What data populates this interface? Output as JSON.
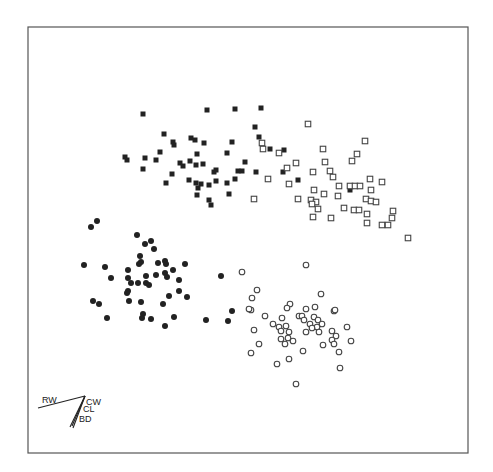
{
  "chart_data": {
    "type": "scatter",
    "title": "",
    "xlabel": "",
    "ylabel": "",
    "grid": false,
    "legend": null,
    "frame": {
      "x0": 28,
      "y0": 27,
      "x1": 468,
      "y1": 453
    },
    "series": [
      {
        "name": "group-filled-square",
        "marker": "filled-square",
        "points": [
          [
            143,
            114
          ],
          [
            207,
            110
          ],
          [
            235,
            109
          ],
          [
            261,
            108
          ],
          [
            255,
            127
          ],
          [
            259,
            137
          ],
          [
            270,
            149
          ],
          [
            284,
            150
          ],
          [
            164,
            134
          ],
          [
            173,
            142
          ],
          [
            174,
            145
          ],
          [
            191,
            138
          ],
          [
            195,
            140
          ],
          [
            204,
            143
          ],
          [
            232,
            142
          ],
          [
            125,
            157
          ],
          [
            127,
            160
          ],
          [
            145,
            158
          ],
          [
            156,
            160
          ],
          [
            160,
            152
          ],
          [
            143,
            169
          ],
          [
            180,
            163
          ],
          [
            183,
            166
          ],
          [
            190,
            161
          ],
          [
            197,
            154
          ],
          [
            196,
            165
          ],
          [
            203,
            164
          ],
          [
            227,
            153
          ],
          [
            245,
            162
          ],
          [
            242,
            171
          ],
          [
            256,
            172
          ],
          [
            283,
            172
          ],
          [
            298,
            180
          ],
          [
            172,
            174
          ],
          [
            166,
            183
          ],
          [
            189,
            180
          ],
          [
            196,
            183
          ],
          [
            201,
            184
          ],
          [
            198,
            188
          ],
          [
            209,
            185
          ],
          [
            216,
            181
          ],
          [
            214,
            172
          ],
          [
            216,
            170
          ],
          [
            227,
            183
          ],
          [
            235,
            179
          ],
          [
            238,
            171
          ],
          [
            197,
            195
          ],
          [
            209,
            200
          ],
          [
            211,
            205
          ],
          [
            229,
            194
          ],
          [
            350,
            190
          ]
        ]
      },
      {
        "name": "group-open-square",
        "marker": "open-square",
        "points": [
          [
            308,
            124
          ],
          [
            365,
            141
          ],
          [
            262,
            143
          ],
          [
            263,
            149
          ],
          [
            279,
            153
          ],
          [
            323,
            149
          ],
          [
            357,
            154
          ],
          [
            352,
            161
          ],
          [
            296,
            163
          ],
          [
            325,
            162
          ],
          [
            287,
            168
          ],
          [
            313,
            172
          ],
          [
            330,
            171
          ],
          [
            333,
            177
          ],
          [
            268,
            179
          ],
          [
            289,
            184
          ],
          [
            339,
            186
          ],
          [
            350,
            186
          ],
          [
            355,
            186
          ],
          [
            360,
            186
          ],
          [
            370,
            179
          ],
          [
            382,
            182
          ],
          [
            314,
            190
          ],
          [
            324,
            194
          ],
          [
            338,
            196
          ],
          [
            371,
            190
          ],
          [
            254,
            199
          ],
          [
            298,
            199
          ],
          [
            311,
            200
          ],
          [
            316,
            202
          ],
          [
            312,
            204
          ],
          [
            318,
            209
          ],
          [
            344,
            208
          ],
          [
            354,
            210
          ],
          [
            359,
            210
          ],
          [
            366,
            199
          ],
          [
            371,
            201
          ],
          [
            376,
            202
          ],
          [
            367,
            214
          ],
          [
            313,
            217
          ],
          [
            331,
            218
          ],
          [
            367,
            223
          ],
          [
            382,
            225
          ],
          [
            388,
            225
          ],
          [
            392,
            218
          ],
          [
            393,
            211
          ],
          [
            408,
            238
          ]
        ]
      },
      {
        "name": "group-filled-circle",
        "marker": "filled-circle",
        "points": [
          [
            97,
            221
          ],
          [
            91,
            227
          ],
          [
            137,
            235
          ],
          [
            145,
            244
          ],
          [
            151,
            241
          ],
          [
            154,
            249
          ],
          [
            140,
            256
          ],
          [
            141,
            262
          ],
          [
            139,
            264
          ],
          [
            84,
            265
          ],
          [
            105,
            267
          ],
          [
            158,
            263
          ],
          [
            165,
            261
          ],
          [
            166,
            264
          ],
          [
            185,
            264
          ],
          [
            128,
            270
          ],
          [
            173,
            270
          ],
          [
            111,
            278
          ],
          [
            128,
            278
          ],
          [
            156,
            275
          ],
          [
            165,
            273
          ],
          [
            167,
            277
          ],
          [
            146,
            276
          ],
          [
            179,
            280
          ],
          [
            131,
            283
          ],
          [
            138,
            283
          ],
          [
            146,
            283
          ],
          [
            149,
            285
          ],
          [
            128,
            291
          ],
          [
            127,
            293
          ],
          [
            179,
            291
          ],
          [
            169,
            296
          ],
          [
            187,
            297
          ],
          [
            93,
            301
          ],
          [
            99,
            304
          ],
          [
            129,
            301
          ],
          [
            141,
            302
          ],
          [
            163,
            304
          ],
          [
            107,
            318
          ],
          [
            143,
            314
          ],
          [
            142,
            318
          ],
          [
            151,
            319
          ],
          [
            174,
            317
          ],
          [
            165,
            326
          ],
          [
            221,
            276
          ],
          [
            232,
            311
          ],
          [
            228,
            321
          ],
          [
            206,
            320
          ]
        ]
      },
      {
        "name": "group-open-circle",
        "marker": "open-circle",
        "points": [
          [
            306,
            265
          ],
          [
            242,
            272
          ],
          [
            257,
            290
          ],
          [
            252,
            298
          ],
          [
            321,
            294
          ],
          [
            290,
            304
          ],
          [
            287,
            308
          ],
          [
            251,
            310
          ],
          [
            306,
            309
          ],
          [
            315,
            307
          ],
          [
            334,
            311
          ],
          [
            249,
            309
          ],
          [
            265,
            316
          ],
          [
            282,
            318
          ],
          [
            299,
            316
          ],
          [
            302,
            316
          ],
          [
            304,
            320
          ],
          [
            314,
            317
          ],
          [
            318,
            320
          ],
          [
            273,
            324
          ],
          [
            279,
            327
          ],
          [
            286,
            326
          ],
          [
            310,
            324
          ],
          [
            322,
            324
          ],
          [
            347,
            327
          ],
          [
            317,
            327
          ],
          [
            312,
            328
          ],
          [
            254,
            330
          ],
          [
            281,
            331
          ],
          [
            289,
            332
          ],
          [
            306,
            332
          ],
          [
            319,
            332
          ],
          [
            332,
            331
          ],
          [
            336,
            336
          ],
          [
            281,
            339
          ],
          [
            288,
            338
          ],
          [
            293,
            341
          ],
          [
            285,
            344
          ],
          [
            259,
            344
          ],
          [
            332,
            340
          ],
          [
            351,
            341
          ],
          [
            334,
            344
          ],
          [
            323,
            345
          ],
          [
            251,
            353
          ],
          [
            303,
            351
          ],
          [
            339,
            352
          ],
          [
            277,
            364
          ],
          [
            289,
            359
          ],
          [
            340,
            368
          ],
          [
            296,
            384
          ],
          [
            335,
            310
          ]
        ]
      }
    ],
    "biplot_vectors": {
      "origin": [
        85,
        396
      ],
      "vectors": [
        {
          "label": "RW",
          "end": [
            38,
            408
          ],
          "label_pos": [
            42,
            403
          ]
        },
        {
          "label": "CW",
          "end": [
            72,
            426
          ],
          "label_pos": [
            86,
            405
          ]
        },
        {
          "label": "CL",
          "end": [
            70,
            427
          ],
          "label_pos": [
            83,
            412
          ]
        },
        {
          "label": "BD",
          "end": [
            73,
            428
          ],
          "label_pos": [
            79,
            422
          ]
        }
      ]
    }
  }
}
